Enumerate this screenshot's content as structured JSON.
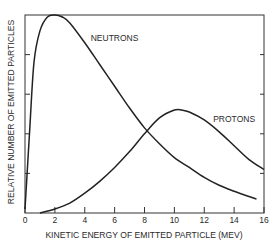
{
  "chart_data": {
    "type": "line",
    "title": "",
    "xlabel": "KINETIC ENERGY OF EMITTED PARTICLE (MEV)",
    "ylabel": "RELATIVE NUMBER OF EMITTED PARTICLES",
    "xlim": [
      0,
      16
    ],
    "ylim": [
      0,
      5
    ],
    "x_ticks": [
      0,
      2,
      4,
      6,
      8,
      10,
      12,
      14,
      16
    ],
    "x_tick_labels": [
      "0",
      "2",
      "4",
      "6",
      "8",
      "10",
      "12",
      "14",
      "16"
    ],
    "y_ticks": [
      1,
      2,
      3,
      4
    ],
    "y_tick_labels": [],
    "y_origin_label": "0",
    "grid": false,
    "legend": null,
    "series": [
      {
        "name": "NEUTRONS",
        "x": [
          0,
          0.3,
          0.6,
          1.0,
          1.5,
          2.0,
          2.5,
          3.0,
          4.0,
          5.0,
          6.0,
          7.0,
          8.0,
          9.0,
          10.0,
          11.0,
          12.0,
          13.0,
          14.0,
          15.5
        ],
        "y": [
          0.1,
          2.0,
          3.8,
          4.6,
          4.95,
          5.0,
          4.95,
          4.8,
          4.3,
          3.75,
          3.2,
          2.65,
          2.15,
          1.75,
          1.4,
          1.15,
          0.9,
          0.7,
          0.55,
          0.35
        ]
      },
      {
        "name": "PROTONS",
        "x": [
          1.0,
          2.0,
          3.0,
          4.0,
          5.0,
          6.0,
          7.0,
          8.0,
          9.0,
          10.0,
          10.5,
          11.0,
          12.0,
          13.0,
          14.0,
          15.0,
          16.0
        ],
        "y": [
          0.0,
          0.1,
          0.25,
          0.5,
          0.8,
          1.15,
          1.55,
          2.0,
          2.4,
          2.6,
          2.6,
          2.55,
          2.35,
          2.05,
          1.7,
          1.35,
          1.1
        ]
      }
    ],
    "annotations": [
      {
        "text": "NEUTRONS",
        "x": 4.4,
        "y": 4.35
      },
      {
        "text": "PROTONS",
        "x": 12.6,
        "y": 2.3
      }
    ]
  }
}
